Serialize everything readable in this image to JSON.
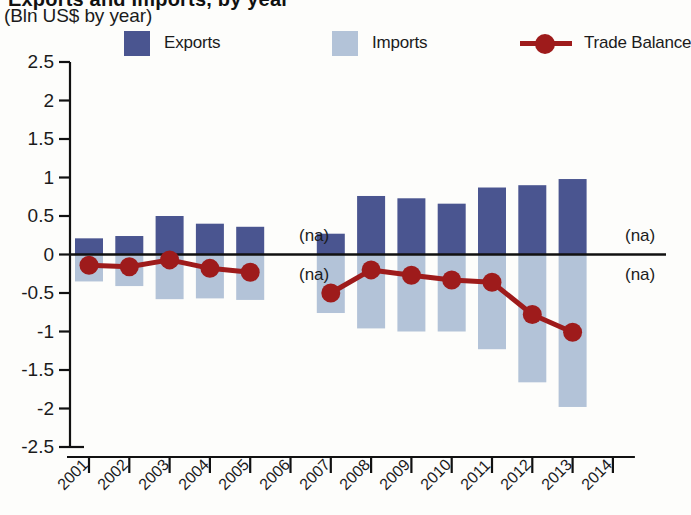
{
  "header": {
    "title_clipped": "Exports and Imports, by year",
    "subtitle": "(Bln US$ by year)"
  },
  "legend": {
    "items": [
      {
        "label": "Exports",
        "type": "swatch",
        "color": "#4a5590",
        "x": 0
      },
      {
        "label": "Imports",
        "type": "swatch",
        "color": "#b3c3d8",
        "x": 208
      },
      {
        "label": "Trade Balance",
        "type": "line",
        "color": "#9e1b1b",
        "x": 396
      }
    ]
  },
  "annotations": {
    "na_text": "(na)",
    "positions": [
      {
        "x": 299,
        "y": 226
      },
      {
        "x": 299,
        "y": 265
      },
      {
        "x": 625,
        "y": 226
      },
      {
        "x": 625,
        "y": 265
      }
    ]
  },
  "colors": {
    "exports": "#4a5590",
    "imports": "#b3c3d8",
    "balance": "#9e1b1b",
    "axis": "#111111",
    "text": "#1b1b1b",
    "background": "#fdfdfb"
  },
  "chart_data": {
    "type": "bar",
    "title": "Exports and Imports, by year",
    "subtitle": "(Bln US$ by year)",
    "xlabel": "",
    "ylabel": "",
    "ylim": [
      -2.5,
      2.5
    ],
    "ytick_values": [
      2.5,
      2,
      1.5,
      1,
      0.5,
      0,
      -0.5,
      -1,
      -1.5,
      -2,
      -2.5
    ],
    "ytick_labels": [
      "2.5",
      "2",
      "1.5",
      "1",
      "0.5",
      "0",
      "-0.5",
      "-1",
      "-1.5",
      "-2",
      "-2.5"
    ],
    "categories": [
      "2001",
      "2002",
      "2003",
      "2004",
      "2005",
      "2006",
      "2007",
      "2008",
      "2009",
      "2010",
      "2011",
      "2012",
      "2013",
      "2014"
    ],
    "xtick_labels": [
      "2001",
      "2002",
      "2003",
      "2004",
      "2005",
      "2006",
      "2007",
      "2008",
      "2009",
      "2010",
      "2011",
      "2012",
      "2013",
      "2014"
    ],
    "grid": false,
    "legend_position": "top",
    "series": [
      {
        "name": "Exports",
        "type": "bar",
        "color": "#4a5590",
        "values": [
          0.21,
          0.24,
          0.5,
          0.4,
          0.36,
          null,
          0.27,
          0.76,
          0.73,
          0.66,
          0.87,
          0.9,
          0.98,
          null
        ]
      },
      {
        "name": "Imports",
        "type": "bar",
        "color": "#b3c3d8",
        "values": [
          -0.35,
          -0.41,
          -0.58,
          -0.57,
          -0.59,
          null,
          -0.76,
          -0.96,
          -1.0,
          -1.0,
          -1.23,
          -1.66,
          -1.98,
          null
        ]
      },
      {
        "name": "Trade Balance",
        "type": "line",
        "color": "#9e1b1b",
        "values": [
          -0.14,
          -0.16,
          -0.07,
          -0.18,
          -0.23,
          null,
          -0.5,
          -0.2,
          -0.27,
          -0.33,
          -0.36,
          -0.78,
          -1.01,
          null
        ]
      }
    ]
  }
}
